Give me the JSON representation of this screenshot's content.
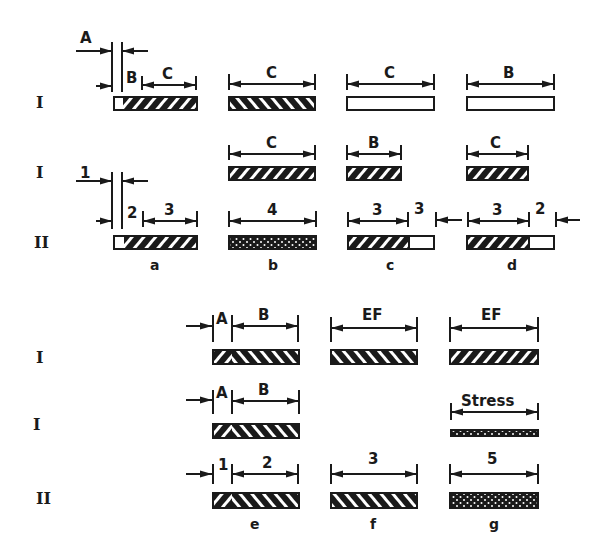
{
  "figure": {
    "top_panel": {
      "row_labels": [
        "I",
        "I",
        "II"
      ],
      "offset_labels_row1": {
        "A": "A",
        "B": "B"
      },
      "offset_labels_row3": {
        "one": "1",
        "two": "2"
      },
      "columns": [
        {
          "caption": "a",
          "row1_dim": "C",
          "row3_dim": "3"
        },
        {
          "caption": "b",
          "row1_dim": "C",
          "row2_dim": "C",
          "row3_dim": "4"
        },
        {
          "caption": "c",
          "row1_dim": "C",
          "row2_dim": "B",
          "row3_dim": "3",
          "row3_side": "3"
        },
        {
          "caption": "d",
          "row1_dim": "B",
          "row2_dim": "C",
          "row3_dim": "3",
          "row3_side": "2"
        }
      ]
    },
    "bottom_panel": {
      "row_labels": [
        "I",
        "I",
        "II"
      ],
      "columns": [
        {
          "caption": "e",
          "row1_offset": "A",
          "row1_dim": "B",
          "row2_offset": "A",
          "row2_dim": "B",
          "row3_offset": "1",
          "row3_dim": "2"
        },
        {
          "caption": "f",
          "row1_dim": "EF",
          "row3_dim": "3"
        },
        {
          "caption": "g",
          "row1_dim": "EF",
          "row2_dim": "Stress",
          "row3_dim": "5"
        }
      ]
    }
  }
}
